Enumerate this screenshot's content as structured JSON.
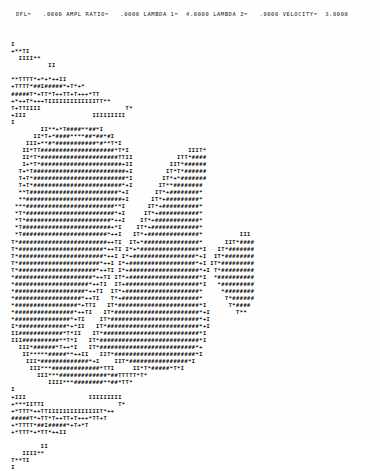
{
  "document": {
    "kind": "line-printer-ascii-plot",
    "background_color": "#ffffff",
    "ink_color": "#0d0d0d"
  },
  "header": {
    "full_line": "DFL=   .0000 AMPL RATIO=   .0000 LAMBDA 1=  4.0000 LAMBDA 2=   .0000 VELOCITY=  3.0000",
    "fields": [
      {
        "label": "DFL=",
        "value": ".0000"
      },
      {
        "label": "AMPL RATIO=",
        "value": ".0000"
      },
      {
        "label": "LAMBDA 1=",
        "value": "4.0000"
      },
      {
        "label": "LAMBDA 2=",
        "value": ".0000"
      },
      {
        "label": "VELOCITY=",
        "value": "3.0000"
      }
    ]
  },
  "plot": {
    "title": "",
    "glyph_ramp": [
      "I",
      "T",
      "+",
      "*",
      "#"
    ],
    "glyph_ramp_meaning": "light-to-dark density shading",
    "columns": 96,
    "rows": 56,
    "art": "  I\n  +**TI\n    IIII**\n            II\n\n  **TTTT*+*+*++II\n  +TTTT*##I#####*+T*+*\n  #####T*+TT*T++TT+T+++*TT\n  +*++T*+++TIIIIIIIIIIIIITT**\n  T+TTIIII                       T*\n  +III                  IIIIIIIII\n  I\n          II**+*T####**##*I\n        II*T+*####****##*##*#I\n      III+**#*###########*#**T*I\n     II*TT####################*T*I                IIIT*\n     II*T*#####################TTII            ITT*####\n     I+*T*######################+II          IIT*######\n    T+*T#########################+I         IT*T*######\n    T+T*#########################*I        IT*+*#######\n    T+T*########################*+I       IT**########\n    **T########################*+I       IT*+########*\n    **##########################+I      IT*+#########*\n   ***########################**I      IT*+##########*\n   *T*########################*+I     IT*+###########*\n   *T*#######################*++I    IT*+############*\n   *T########################+*I    IT*+#############*\n   *T#######################*++I   IT*+##############*          III\n  T*########################++TI  IT+*###############*      IIT*####\n  T*#######################*++TI I*+*################*I   IT*#######\n  T*#######################*++I I*+#################*+I  IT*########\n  T*######################*++I I*+##################*+I IT*#########\n  T*#####################*++TI I*+###################*+I T*#########\n  *#####################*++TI IT*+###################*I  *##########\n  *####################*++TI  IT+####################*I   *#########\n  *###################*++TI  IT*+####################*     *########\n  *##################*++TI   T*+#####################*      T*######\n  *#################*+TTI   IT*######################*I      T*####\n  *################*++TI   IT*#######################*+I       T**\n  *###############*+TI    IT*########################*+I\n  I*#############*+*II   IT*#########################*+I\n  II############*T*II   IT*##########################*I\n  III##########**T*I   IT*###########################*I\n    III*######*T++*I   IT*##########################*+\n     II*****#####**++II   IIT*######################*I\n      III*#############*+I    IIT*################*I\n       III***#############*TTI     II*T*#####*T*I\n         III***#############*##TTTTT*T*\n            IIII***########**##*TT*\n  I\n  +III                 IIIIIIIII\n  +***IITTI                    T*\n  +*TTT*++TTIIIIIIIIIIIIIIT*++\n  #####T*+TT*T++TT+T+++*TT+T\n  +*TTTT*##I#####*+T+*T\n  +*TTT*+*TT*++II\n\n          II\n     IIII**\n  T**TI\n  I"
  }
}
